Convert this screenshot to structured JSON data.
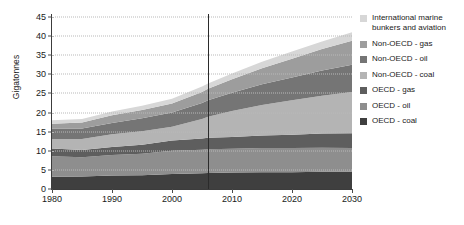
{
  "chart_data": {
    "type": "area",
    "stacked": true,
    "title": "",
    "xlabel": "",
    "ylabel": "Gigatonnes",
    "xlim": [
      1980,
      2030
    ],
    "ylim": [
      0,
      45
    ],
    "yticks": [
      0,
      5,
      10,
      15,
      20,
      25,
      30,
      35,
      40,
      45
    ],
    "xticks": [
      1980,
      1990,
      2000,
      2010,
      2020,
      2030
    ],
    "grid": true,
    "legend_position": "right",
    "annotations": [
      {
        "type": "vline",
        "x": 2006,
        "label": ""
      }
    ],
    "x": [
      1980,
      1985,
      1990,
      1995,
      2000,
      2005,
      2006,
      2010,
      2015,
      2020,
      2025,
      2030
    ],
    "series": [
      {
        "name": "OECD - coal",
        "color": "#3f3f3f",
        "values": [
          3.2,
          3.3,
          3.5,
          3.6,
          3.9,
          4.1,
          4.2,
          4.3,
          4.4,
          4.4,
          4.5,
          4.5
        ]
      },
      {
        "name": "OECD - oil",
        "color": "#8e8e8e",
        "values": [
          5.4,
          5.0,
          5.4,
          5.6,
          6.1,
          6.2,
          6.2,
          6.2,
          6.3,
          6.3,
          6.3,
          6.2
        ]
      },
      {
        "name": "OECD - gas",
        "color": "#5e5e5e",
        "values": [
          2.0,
          1.9,
          2.1,
          2.4,
          2.7,
          2.9,
          3.0,
          3.1,
          3.3,
          3.5,
          3.7,
          3.9
        ]
      },
      {
        "name": "Non-OECD - coal",
        "color": "#b4b4b4",
        "values": [
          2.5,
          2.9,
          3.3,
          3.5,
          3.6,
          5.1,
          5.5,
          6.8,
          8.0,
          9.0,
          9.9,
          10.8
        ]
      },
      {
        "name": "Non-OECD - oil",
        "color": "#757575",
        "values": [
          2.7,
          2.7,
          3.0,
          3.4,
          3.7,
          4.2,
          4.3,
          4.8,
          5.4,
          6.0,
          6.6,
          7.1
        ]
      },
      {
        "name": "Non-OECD - gas",
        "color": "#9d9d9d",
        "values": [
          1.3,
          1.6,
          2.0,
          2.2,
          2.4,
          2.9,
          3.0,
          3.5,
          4.2,
          4.9,
          5.6,
          6.3
        ]
      },
      {
        "name": "International marine bunkers and aviation",
        "color": "#d7d7d7",
        "values": [
          0.9,
          0.9,
          1.0,
          1.1,
          1.2,
          1.4,
          1.4,
          1.5,
          1.7,
          1.9,
          2.0,
          2.2
        ]
      }
    ],
    "totals": [
      18.0,
      18.3,
      20.3,
      21.8,
      23.6,
      26.8,
      27.6,
      30.2,
      33.3,
      36.0,
      38.6,
      41.0
    ]
  },
  "legend": {
    "items": [
      {
        "label": "International marine\nbunkers and aviation",
        "color": "#d7d7d7"
      },
      {
        "label": "Non-OECD - gas",
        "color": "#9d9d9d"
      },
      {
        "label": "Non-OECD - oil",
        "color": "#757575"
      },
      {
        "label": "Non-OECD - coal",
        "color": "#b4b4b4"
      },
      {
        "label": "OECD - gas",
        "color": "#5e5e5e"
      },
      {
        "label": "OECD - oil",
        "color": "#8e8e8e"
      },
      {
        "label": "OECD - coal",
        "color": "#3f3f3f"
      }
    ]
  }
}
